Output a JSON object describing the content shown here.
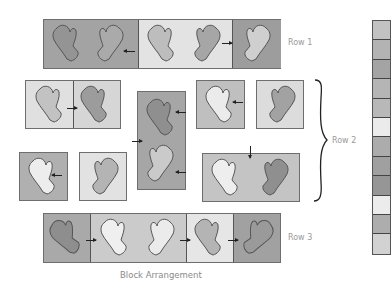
{
  "labels": {
    "row1": "Row 1",
    "row2": "Row 2",
    "row3": "Row 3",
    "caption": "Block Arrangement"
  },
  "colors": {
    "dark": "#9b9b9b",
    "mid": "#b3b3b3",
    "light": "#d4d4d4",
    "pale": "#e6e6e6",
    "mitten_dark": "#8c8c8c",
    "mitten_mid": "#a8a8a8",
    "mitten_light": "#c8c8c8",
    "mitten_pale": "#ececec"
  },
  "row1": {
    "cells": [
      {
        "width": 95,
        "bg": "#a3a3a3",
        "mittens": [
          {
            "fill": "#949494",
            "flip": false
          },
          {
            "fill": "#aaaaaa",
            "flip": true
          }
        ]
      },
      {
        "width": 94,
        "bg": "#e3e3e3",
        "mittens": [
          {
            "fill": "#bdbdbd",
            "flip": false
          },
          {
            "fill": "#a6a6a6",
            "flip": true
          }
        ]
      },
      {
        "width": 48,
        "bg": "#9d9d9d",
        "mittens": [
          {
            "fill": "#cfcfcf",
            "flip": true
          }
        ]
      }
    ]
  },
  "row2": {
    "blocks": [
      {
        "name": "pair-horizontal-left",
        "cells": [
          {
            "bg": "#e0e0e0",
            "mitten": "#c2c2c2"
          },
          {
            "bg": "#d6d6d6",
            "mitten": "#9c9c9c"
          }
        ]
      },
      {
        "name": "pair-vertical-center",
        "bg": "#a6a6a6",
        "mittens": [
          "#8f8f8f",
          "#cacaca"
        ]
      },
      {
        "name": "single-top-right-1",
        "bg": "#bfbfbf",
        "mitten": "#ebebeb"
      },
      {
        "name": "single-top-right-2",
        "bg": "#dcdcdc",
        "mitten": "#a2a2a2"
      },
      {
        "name": "single-bottom-left-1",
        "bg": "#b0b0b0",
        "mitten": "#ededed"
      },
      {
        "name": "single-bottom-left-2",
        "bg": "#e2e2e2",
        "mitten": "#b4b4b4"
      },
      {
        "name": "pair-horizontal-right",
        "bg": "#c4c4c4",
        "mittens": [
          "#eeeeee",
          "#8f8f8f"
        ]
      }
    ]
  },
  "row3": {
    "cells": [
      {
        "width": 47,
        "bg": "#a9a9a9",
        "mittens": [
          "#8e8e8e"
        ]
      },
      {
        "width": 96,
        "bg": "#cbcbcb",
        "mittens": [
          "#efefef",
          "#ebebeb"
        ]
      },
      {
        "width": 47,
        "bg": "#e6e6e6",
        "mittens": [
          "#b4b4b4"
        ]
      },
      {
        "width": 48,
        "bg": "#a1a1a1",
        "mittens": [
          "#9a9a9a"
        ]
      }
    ]
  },
  "strip": {
    "squares": [
      "#c2c2c2",
      "#b3b3b3",
      "#a4a4a4",
      "#b5b5b5",
      "#b8b8b8",
      "#ebebeb",
      "#acacac",
      "#a0a0a0",
      "#969696",
      "#ececec",
      "#adadad",
      "#d2d2d2"
    ]
  }
}
